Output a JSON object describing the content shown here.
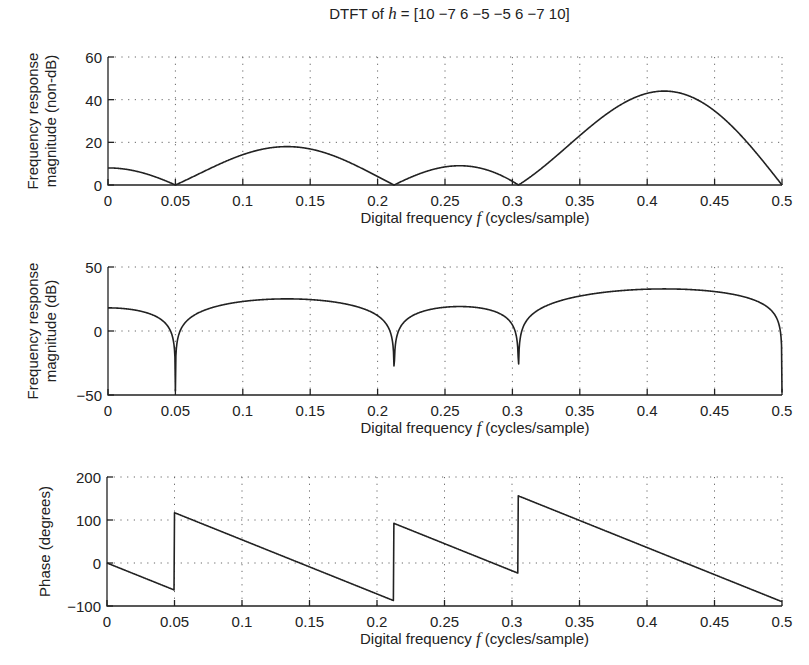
{
  "figure": {
    "title_prefix": "DTFT of ",
    "title_var": "h",
    "title_suffix": " =  [10  −7  6   −5   −5  6  −7  10]"
  },
  "chart_data": [
    {
      "type": "line",
      "title": "DTFT of h = [10 -7 6 -5 -5 6 -7 10]",
      "xlabel": "Digital frequency f (cycles/sample)",
      "ylabel": "Frequency response magnitude (non-dB)",
      "xlim": [
        0,
        0.5
      ],
      "ylim": [
        0,
        60
      ],
      "xticks": [
        0,
        0.05,
        0.1,
        0.15,
        0.2,
        0.25,
        0.3,
        0.35,
        0.4,
        0.45,
        0.5
      ],
      "xtick_labels": [
        "0",
        "0.05",
        "0.1",
        "0.15",
        "0.2",
        "0.25",
        "0.3",
        "0.35",
        "0.4",
        "0.45",
        "0.5"
      ],
      "yticks": [
        0,
        20,
        40,
        60
      ],
      "ytick_labels": [
        "0",
        "20",
        "40",
        "60"
      ],
      "grid": true,
      "series": [
        {
          "name": "|H(f)|",
          "source": "computed from h",
          "key_points": [
            {
              "x": 0,
              "y": 8
            },
            {
              "x": 0.06,
              "y": 0
            },
            {
              "x": 0.14,
              "y": 17.5
            },
            {
              "x": 0.222,
              "y": 0
            },
            {
              "x": 0.27,
              "y": 8.5
            },
            {
              "x": 0.314,
              "y": 0
            },
            {
              "x": 0.42,
              "y": 43
            },
            {
              "x": 0.5,
              "y": 0
            }
          ]
        }
      ]
    },
    {
      "type": "line",
      "xlabel": "Digital frequency f (cycles/sample)",
      "ylabel": "Frequency response magnitude (dB)",
      "xlim": [
        0,
        0.5
      ],
      "ylim": [
        -50,
        50
      ],
      "xticks": [
        0,
        0.05,
        0.1,
        0.15,
        0.2,
        0.25,
        0.3,
        0.35,
        0.4,
        0.45,
        0.5
      ],
      "xtick_labels": [
        "0",
        "0.05",
        "0.1",
        "0.15",
        "0.2",
        "0.25",
        "0.3",
        "0.35",
        "0.4",
        "0.45",
        "0.5"
      ],
      "yticks": [
        -50,
        0,
        50
      ],
      "ytick_labels": [
        "−50",
        "0",
        "50"
      ],
      "grid": true,
      "series": [
        {
          "name": "20log10|H(f)|",
          "source": "computed from h",
          "key_points": [
            {
              "x": 0,
              "y": 18
            },
            {
              "x": 0.06,
              "y": -25
            },
            {
              "x": 0.14,
              "y": 24.9
            },
            {
              "x": 0.222,
              "y": -20
            },
            {
              "x": 0.27,
              "y": 18.6
            },
            {
              "x": 0.314,
              "y": -24
            },
            {
              "x": 0.42,
              "y": 32.7
            },
            {
              "x": 0.5,
              "y": -5
            }
          ]
        }
      ]
    },
    {
      "type": "line",
      "xlabel": "Digital frequency f (cycles/sample)",
      "ylabel": "Phase (degrees)",
      "xlim": [
        0,
        0.5
      ],
      "ylim": [
        -100,
        200
      ],
      "xticks": [
        0,
        0.05,
        0.1,
        0.15,
        0.2,
        0.25,
        0.3,
        0.35,
        0.4,
        0.45,
        0.5
      ],
      "xtick_labels": [
        "0",
        "0.05",
        "0.1",
        "0.15",
        "0.2",
        "0.25",
        "0.3",
        "0.35",
        "0.4",
        "0.45",
        "0.5"
      ],
      "yticks": [
        -100,
        0,
        100,
        200
      ],
      "ytick_labels": [
        "−100",
        "0",
        "100",
        "200"
      ],
      "grid": true,
      "series": [
        {
          "name": "angle H(f)",
          "source": "computed from h",
          "key_points": [
            {
              "x": 0,
              "y": 0
            },
            {
              "x": 0.06,
              "y": -64
            },
            {
              "x": 0.0601,
              "y": 116
            },
            {
              "x": 0.222,
              "y": -88
            },
            {
              "x": 0.2221,
              "y": 92
            },
            {
              "x": 0.314,
              "y": -23
            },
            {
              "x": 0.3141,
              "y": 157
            },
            {
              "x": 0.5,
              "y": -90
            }
          ]
        }
      ]
    }
  ]
}
